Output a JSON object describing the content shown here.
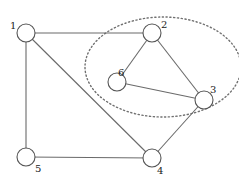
{
  "diagram": {
    "type": "undirected-graph",
    "node_radius": 9,
    "nodes": [
      {
        "id": "1",
        "label": "1",
        "x": 26,
        "y": 33,
        "lx": 10,
        "ly": 29
      },
      {
        "id": "2",
        "label": "2",
        "x": 152,
        "y": 33,
        "lx": 161,
        "ly": 28
      },
      {
        "id": "3",
        "label": "3",
        "x": 204,
        "y": 100,
        "lx": 210,
        "ly": 93
      },
      {
        "id": "4",
        "label": "4",
        "x": 152,
        "y": 158,
        "lx": 157,
        "ly": 174
      },
      {
        "id": "5",
        "label": "5",
        "x": 26,
        "y": 157,
        "lx": 35,
        "ly": 172
      },
      {
        "id": "6",
        "label": "6",
        "x": 117,
        "y": 82,
        "lx": 118,
        "ly": 76
      }
    ],
    "edges": [
      {
        "from": "1",
        "to": "2"
      },
      {
        "from": "1",
        "to": "5"
      },
      {
        "from": "1",
        "to": "4"
      },
      {
        "from": "2",
        "to": "6"
      },
      {
        "from": "2",
        "to": "3"
      },
      {
        "from": "6",
        "to": "3"
      },
      {
        "from": "3",
        "to": "4"
      },
      {
        "from": "5",
        "to": "4"
      }
    ],
    "cluster": {
      "style": "dotted-ellipse",
      "members": [
        "2",
        "3",
        "6"
      ],
      "cx": 163,
      "cy": 67,
      "rx": 78,
      "ry": 50
    }
  }
}
